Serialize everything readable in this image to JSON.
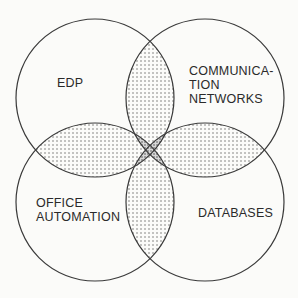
{
  "diagram": {
    "type": "venn",
    "circles": [
      {
        "id": "edp",
        "label_lines": [
          "EDP"
        ]
      },
      {
        "id": "communication-networks",
        "label_lines": [
          "COMMUNICA-",
          "TION",
          "NETWORKS"
        ]
      },
      {
        "id": "office-automation",
        "label_lines": [
          "OFFICE",
          "AUTOMATION"
        ]
      },
      {
        "id": "databases",
        "label_lines": [
          "DATABASES"
        ]
      }
    ],
    "colors": {
      "line": "#3a3a3a",
      "background": "#fbfbf9",
      "dots": "#6a6a6a"
    }
  }
}
